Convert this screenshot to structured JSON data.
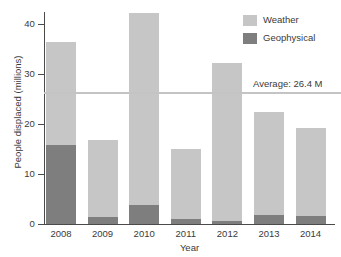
{
  "chart_data": {
    "type": "bar",
    "stacked": true,
    "title": "",
    "xlabel": "Year",
    "ylabel": "People displaced (millions)",
    "categories": [
      "2008",
      "2009",
      "2010",
      "2011",
      "2012",
      "2013",
      "2014"
    ],
    "series": [
      {
        "name": "Geophysical",
        "color": "#7e7e7e",
        "values": [
          15.8,
          1.4,
          3.9,
          1.1,
          0.6,
          1.9,
          1.6
        ]
      },
      {
        "name": "Weather",
        "color": "#c6c6c6",
        "values": [
          20.6,
          15.4,
          38.3,
          13.9,
          31.6,
          20.5,
          17.6
        ]
      }
    ],
    "totals": [
      36.4,
      16.8,
      42.2,
      15.0,
      32.2,
      22.4,
      19.2
    ],
    "ylim": [
      0,
      43
    ],
    "yticks": [
      0,
      10,
      20,
      30,
      40
    ],
    "ytick_labels": [
      "0",
      "10",
      "20",
      "30",
      "40"
    ],
    "grid": false,
    "legend_position": "top-right",
    "annotations": [
      {
        "name": "average-line",
        "label": "Average: 26.4 M",
        "value": 26.4,
        "orientation": "horizontal",
        "color": "#c4c4c4"
      }
    ]
  },
  "legend": {
    "items": [
      {
        "label": "Weather",
        "color": "#c6c6c6"
      },
      {
        "label": "Geophysical",
        "color": "#7e7e7e"
      }
    ]
  }
}
